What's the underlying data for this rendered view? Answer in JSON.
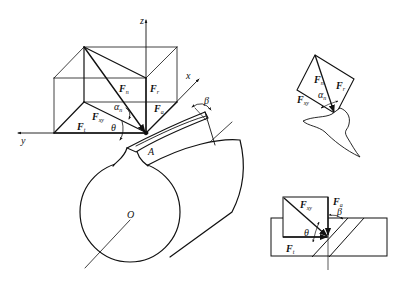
{
  "figure": {
    "colors": {
      "stroke": "#111111",
      "background": "#ffffff"
    }
  },
  "main_view": {
    "axes": {
      "z": "z",
      "y": "y",
      "x": "x"
    },
    "forces": [
      {
        "id": "Fn",
        "base": "F",
        "sub": "n"
      },
      {
        "id": "Ft_vert",
        "base": "F",
        "sub": "r"
      },
      {
        "id": "Fa",
        "base": "F",
        "sub": "a"
      },
      {
        "id": "Fxy",
        "base": "F",
        "sub": "xy"
      },
      {
        "id": "Ft",
        "base": "F",
        "sub": "t"
      }
    ],
    "angles": {
      "alpha": "α",
      "alpha_sub": "n",
      "theta": "θ",
      "beta": "β"
    },
    "points": {
      "contact": "A",
      "center": "O"
    }
  },
  "normal_section_view": {
    "forces": [
      {
        "id": "Fn",
        "base": "F",
        "sub": "n"
      },
      {
        "id": "Fr",
        "base": "F",
        "sub": "r"
      },
      {
        "id": "Fxy",
        "base": "F",
        "sub": "xy"
      }
    ],
    "angles": {
      "alpha": "α",
      "alpha_sub": "n"
    }
  },
  "top_view": {
    "forces": [
      {
        "id": "Fxy",
        "base": "F",
        "sub": "xy"
      },
      {
        "id": "Fa",
        "base": "F",
        "sub": "a"
      },
      {
        "id": "Ft",
        "base": "F",
        "sub": "t"
      }
    ],
    "angles": {
      "theta": "θ",
      "beta": "β"
    }
  }
}
